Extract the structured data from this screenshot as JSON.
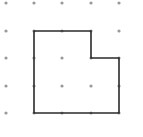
{
  "diagram": {
    "type": "dot-grid-polygon",
    "grid": {
      "columns": 5,
      "rows": 5,
      "x_positions": [
        6,
        34,
        62,
        91,
        119
      ],
      "y_positions": [
        3,
        31,
        58,
        86,
        113
      ],
      "dot_color": "#9a9a9a",
      "dot_radius": 1.6
    },
    "polygon": {
      "stroke_color": "#2b2b2b",
      "stroke_width": 1.6,
      "vertices_grid": [
        [
          1,
          1
        ],
        [
          3,
          1
        ],
        [
          3,
          2
        ],
        [
          4,
          2
        ],
        [
          4,
          4
        ],
        [
          1,
          4
        ]
      ],
      "vertices_px": [
        [
          34,
          31
        ],
        [
          91,
          31
        ],
        [
          91,
          58
        ],
        [
          119,
          58
        ],
        [
          119,
          113
        ],
        [
          34,
          113
        ]
      ]
    }
  }
}
